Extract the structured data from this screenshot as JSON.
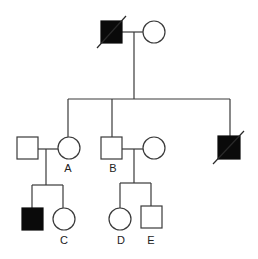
{
  "diagram": {
    "type": "pedigree",
    "legend": {
      "square": "male",
      "circle": "female",
      "filled": "affected",
      "slash": "deceased"
    },
    "colors": {
      "line": "#3a3a3a",
      "affected": "#0a0a0a",
      "unaffected": "#ffffff"
    },
    "generation_1": [
      {
        "id": "I-1",
        "sex": "male",
        "affected": true,
        "deceased": true,
        "label": ""
      },
      {
        "id": "I-2",
        "sex": "female",
        "affected": false,
        "deceased": false,
        "label": ""
      }
    ],
    "generation_2": [
      {
        "id": "II-spouse-A",
        "sex": "male",
        "affected": false,
        "deceased": false,
        "label": "",
        "married_in": true
      },
      {
        "id": "A",
        "sex": "female",
        "affected": false,
        "deceased": false,
        "label": "A"
      },
      {
        "id": "B",
        "sex": "male",
        "affected": false,
        "deceased": false,
        "label": "B"
      },
      {
        "id": "II-spouse-B",
        "sex": "female",
        "affected": false,
        "deceased": false,
        "label": "",
        "married_in": true
      },
      {
        "id": "II-4",
        "sex": "male",
        "affected": true,
        "deceased": true,
        "label": ""
      }
    ],
    "generation_3": [
      {
        "id": "III-1",
        "sex": "male",
        "affected": true,
        "deceased": false,
        "label": "",
        "parents": "A"
      },
      {
        "id": "C",
        "sex": "female",
        "affected": false,
        "deceased": false,
        "label": "C",
        "parents": "A"
      },
      {
        "id": "D",
        "sex": "female",
        "affected": false,
        "deceased": false,
        "label": "D",
        "parents": "B"
      },
      {
        "id": "E",
        "sex": "male",
        "affected": false,
        "deceased": false,
        "label": "E",
        "parents": "B"
      }
    ],
    "labels": {
      "a": "A",
      "b": "B",
      "c": "C",
      "d": "D",
      "e": "E"
    }
  }
}
